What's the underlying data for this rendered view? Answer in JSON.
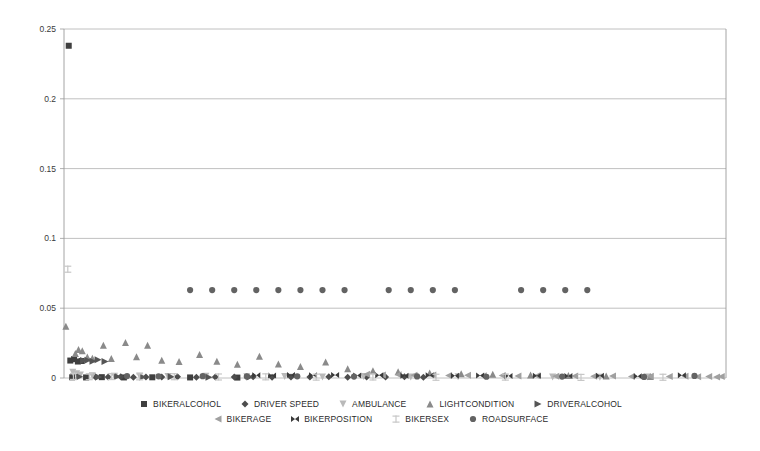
{
  "chart_data": {
    "type": "scatter",
    "title": "",
    "xlabel": "",
    "ylabel": "",
    "ylim": [
      0,
      0.25
    ],
    "xlim": [
      0,
      210
    ],
    "grid": true,
    "y_ticks": [
      0,
      0.05,
      0.1,
      0.15,
      0.2,
      0.25
    ],
    "y_tick_labels": [
      "0",
      "0.05",
      "0.1",
      "0.15",
      "0.2",
      "0.25"
    ],
    "x_axis_visible": false,
    "legend_position": "bottom",
    "series": [
      {
        "name": "BIKERALCOHOL",
        "marker": "square",
        "color": "#3f3f3f",
        "points": [
          {
            "x": 1.5,
            "y": 0.238
          },
          {
            "x": 2.0,
            "y": 0.0125
          },
          {
            "x": 3.2,
            "y": 0.0135
          },
          {
            "x": 4.4,
            "y": 0.0118
          },
          {
            "x": 5.6,
            "y": 0.0122
          },
          {
            "x": 2.6,
            "y": 0.0005
          },
          {
            "x": 7.0,
            "y": 0.0004
          },
          {
            "x": 12.0,
            "y": 0.0006
          },
          {
            "x": 19.0,
            "y": 0.0004
          },
          {
            "x": 28.0,
            "y": 0.0005
          },
          {
            "x": 40.0,
            "y": 0.0004
          },
          {
            "x": 55.0,
            "y": 0.0003
          }
        ]
      },
      {
        "name": "DRIVER SPEED",
        "marker": "diamond",
        "color": "#4d4d4d",
        "points": [
          {
            "x": 10.0,
            "y": 0.0008
          },
          {
            "x": 14.0,
            "y": 0.0007
          },
          {
            "x": 18.0,
            "y": 0.0009
          },
          {
            "x": 22.0,
            "y": 0.0006
          },
          {
            "x": 26.0,
            "y": 0.0008
          },
          {
            "x": 31.0,
            "y": 0.0007
          },
          {
            "x": 36.0,
            "y": 0.0009
          },
          {
            "x": 42.0,
            "y": 0.0006
          },
          {
            "x": 48.0,
            "y": 0.0008
          },
          {
            "x": 54.0,
            "y": 0.0007
          },
          {
            "x": 60.0,
            "y": 0.0009
          },
          {
            "x": 66.0,
            "y": 0.0006
          },
          {
            "x": 72.0,
            "y": 0.0008
          },
          {
            "x": 78.0,
            "y": 0.0007
          },
          {
            "x": 84.0,
            "y": 0.0009
          },
          {
            "x": 90.0,
            "y": 0.0006
          },
          {
            "x": 96.0,
            "y": 0.0008
          },
          {
            "x": 102.0,
            "y": 0.0007
          },
          {
            "x": 108.0,
            "y": 0.0009
          },
          {
            "x": 114.0,
            "y": 0.0006
          }
        ]
      },
      {
        "name": "AMBULANCE",
        "marker": "triangle-down",
        "color": "#b9b9b9",
        "points": [
          {
            "x": 2.8,
            "y": 0.0042
          },
          {
            "x": 4.0,
            "y": 0.003
          },
          {
            "x": 5.2,
            "y": 0.0022
          },
          {
            "x": 9.0,
            "y": 0.0016
          },
          {
            "x": 16.0,
            "y": 0.0012
          },
          {
            "x": 24.0,
            "y": 0.0014
          },
          {
            "x": 33.0,
            "y": 0.001
          },
          {
            "x": 45.0,
            "y": 0.0012
          },
          {
            "x": 58.0,
            "y": 0.0009
          },
          {
            "x": 70.0,
            "y": 0.0011
          },
          {
            "x": 82.0,
            "y": 0.0008
          },
          {
            "x": 95.0,
            "y": 0.001
          },
          {
            "x": 110.0,
            "y": 0.0007
          },
          {
            "x": 125.0,
            "y": 0.0009
          },
          {
            "x": 140.0,
            "y": 0.0006
          },
          {
            "x": 155.0,
            "y": 0.0008
          },
          {
            "x": 170.0,
            "y": 0.0006
          },
          {
            "x": 185.0,
            "y": 0.0007
          }
        ]
      },
      {
        "name": "LIGHTCONDITION",
        "marker": "triangle-up",
        "color": "#8a8a8a",
        "points": [
          {
            "x": 0.6,
            "y": 0.037
          },
          {
            "x": 3.6,
            "y": 0.0175
          },
          {
            "x": 4.6,
            "y": 0.0205
          },
          {
            "x": 5.8,
            "y": 0.0195
          },
          {
            "x": 7.4,
            "y": 0.015
          },
          {
            "x": 9.0,
            "y": 0.0142
          },
          {
            "x": 12.5,
            "y": 0.0235
          },
          {
            "x": 15.0,
            "y": 0.014
          },
          {
            "x": 19.5,
            "y": 0.0255
          },
          {
            "x": 23.0,
            "y": 0.0152
          },
          {
            "x": 26.5,
            "y": 0.0235
          },
          {
            "x": 31.0,
            "y": 0.0128
          },
          {
            "x": 36.5,
            "y": 0.0118
          },
          {
            "x": 43.0,
            "y": 0.0168
          },
          {
            "x": 48.5,
            "y": 0.012
          },
          {
            "x": 55.0,
            "y": 0.0098
          },
          {
            "x": 62.0,
            "y": 0.0155
          },
          {
            "x": 68.0,
            "y": 0.01
          },
          {
            "x": 75.0,
            "y": 0.0082
          },
          {
            "x": 83.0,
            "y": 0.0115
          },
          {
            "x": 90.0,
            "y": 0.0066
          },
          {
            "x": 98.0,
            "y": 0.0052
          },
          {
            "x": 106.0,
            "y": 0.0044
          },
          {
            "x": 116.0,
            "y": 0.0036
          },
          {
            "x": 126.0,
            "y": 0.003
          },
          {
            "x": 136.0,
            "y": 0.0026
          },
          {
            "x": 148.0,
            "y": 0.0022
          },
          {
            "x": 160.0,
            "y": 0.0018
          },
          {
            "x": 172.0,
            "y": 0.0014
          },
          {
            "x": 186.0,
            "y": 0.0011
          }
        ]
      },
      {
        "name": "DRIVERALCOHOL",
        "marker": "triangle-right",
        "color": "#555555",
        "points": [
          {
            "x": 6.2,
            "y": 0.0125
          },
          {
            "x": 7.6,
            "y": 0.0128
          },
          {
            "x": 9.2,
            "y": 0.012
          },
          {
            "x": 10.8,
            "y": 0.013
          },
          {
            "x": 13.0,
            "y": 0.0118
          },
          {
            "x": 5.0,
            "y": 0.0009
          },
          {
            "x": 11.0,
            "y": 0.0008
          },
          {
            "x": 17.0,
            "y": 0.001
          },
          {
            "x": 25.0,
            "y": 0.0007
          },
          {
            "x": 34.0,
            "y": 0.0009
          },
          {
            "x": 46.0,
            "y": 0.0006
          },
          {
            "x": 59.0,
            "y": 0.0008
          }
        ]
      },
      {
        "name": "BIKERAGE",
        "marker": "triangle-left",
        "color": "#a0a0a0",
        "points": [
          {
            "x": 96.0,
            "y": 0.0026
          },
          {
            "x": 101.0,
            "y": 0.0022
          },
          {
            "x": 106.0,
            "y": 0.0024
          },
          {
            "x": 111.0,
            "y": 0.002
          },
          {
            "x": 117.0,
            "y": 0.0022
          },
          {
            "x": 122.0,
            "y": 0.0018
          },
          {
            "x": 128.0,
            "y": 0.002
          },
          {
            "x": 133.0,
            "y": 0.0016
          },
          {
            "x": 139.0,
            "y": 0.0018
          },
          {
            "x": 144.0,
            "y": 0.0015
          },
          {
            "x": 150.0,
            "y": 0.0017
          },
          {
            "x": 156.0,
            "y": 0.0013
          },
          {
            "x": 162.0,
            "y": 0.0015
          },
          {
            "x": 168.0,
            "y": 0.0012
          },
          {
            "x": 174.0,
            "y": 0.0014
          },
          {
            "x": 180.0,
            "y": 0.0011
          },
          {
            "x": 186.0,
            "y": 0.0013
          },
          {
            "x": 192.0,
            "y": 0.001
          },
          {
            "x": 197.0,
            "y": 0.0012
          },
          {
            "x": 201.0,
            "y": 0.0009
          },
          {
            "x": 204.5,
            "y": 0.0011
          },
          {
            "x": 207.0,
            "y": 0.0008
          },
          {
            "x": 208.5,
            "y": 0.001
          }
        ]
      },
      {
        "name": "BIKERPOSITION",
        "marker": "bowtie",
        "color": "#3a3a3a",
        "points": [
          {
            "x": 61.0,
            "y": 0.002
          },
          {
            "x": 66.0,
            "y": 0.0018
          },
          {
            "x": 72.0,
            "y": 0.0022
          },
          {
            "x": 79.0,
            "y": 0.0019
          },
          {
            "x": 86.0,
            "y": 0.0021
          },
          {
            "x": 93.0,
            "y": 0.0018
          },
          {
            "x": 100.0,
            "y": 0.002
          },
          {
            "x": 108.0,
            "y": 0.0017
          },
          {
            "x": 116.0,
            "y": 0.0019
          },
          {
            "x": 124.0,
            "y": 0.0016
          },
          {
            "x": 132.0,
            "y": 0.0018
          },
          {
            "x": 141.0,
            "y": 0.0015
          },
          {
            "x": 150.0,
            "y": 0.0017
          },
          {
            "x": 160.0,
            "y": 0.0014
          },
          {
            "x": 170.0,
            "y": 0.0016
          },
          {
            "x": 182.0,
            "y": 0.0013
          },
          {
            "x": 196.0,
            "y": 0.002
          }
        ]
      },
      {
        "name": "BIKERSEX",
        "marker": "ibeam",
        "color": "#c7c7c7",
        "points": [
          {
            "x": 1.2,
            "y": 0.078
          },
          {
            "x": 3.0,
            "y": 0.0012
          },
          {
            "x": 8.0,
            "y": 0.001
          },
          {
            "x": 15.0,
            "y": 0.0011
          },
          {
            "x": 24.0,
            "y": 0.0009
          },
          {
            "x": 35.0,
            "y": 0.001
          },
          {
            "x": 49.0,
            "y": 0.0008
          },
          {
            "x": 64.0,
            "y": 0.0009
          },
          {
            "x": 80.0,
            "y": 0.0007
          },
          {
            "x": 98.0,
            "y": 0.0008
          },
          {
            "x": 118.0,
            "y": 0.0006
          },
          {
            "x": 140.0,
            "y": 0.0007
          },
          {
            "x": 164.0,
            "y": 0.0005
          },
          {
            "x": 190.0,
            "y": 0.0006
          }
        ]
      },
      {
        "name": "ROADSURFACE",
        "marker": "circle",
        "color": "#636363",
        "points": [
          {
            "x": 40.0,
            "y": 0.063
          },
          {
            "x": 47.0,
            "y": 0.063
          },
          {
            "x": 54.0,
            "y": 0.063
          },
          {
            "x": 61.0,
            "y": 0.063
          },
          {
            "x": 68.0,
            "y": 0.063
          },
          {
            "x": 75.0,
            "y": 0.063
          },
          {
            "x": 82.0,
            "y": 0.063
          },
          {
            "x": 89.0,
            "y": 0.063
          },
          {
            "x": 103.0,
            "y": 0.063
          },
          {
            "x": 110.0,
            "y": 0.063
          },
          {
            "x": 117.0,
            "y": 0.063
          },
          {
            "x": 124.0,
            "y": 0.063
          },
          {
            "x": 145.0,
            "y": 0.063
          },
          {
            "x": 152.0,
            "y": 0.063
          },
          {
            "x": 159.0,
            "y": 0.063
          },
          {
            "x": 166.0,
            "y": 0.063
          },
          {
            "x": 20.0,
            "y": 0.0014
          },
          {
            "x": 30.0,
            "y": 0.0012
          },
          {
            "x": 44.0,
            "y": 0.0013
          },
          {
            "x": 58.0,
            "y": 0.0011
          },
          {
            "x": 74.0,
            "y": 0.0012
          },
          {
            "x": 92.0,
            "y": 0.001
          },
          {
            "x": 112.0,
            "y": 0.0011
          },
          {
            "x": 134.0,
            "y": 0.0009
          },
          {
            "x": 158.0,
            "y": 0.001
          },
          {
            "x": 184.0,
            "y": 0.0008
          },
          {
            "x": 200.0,
            "y": 0.0015
          }
        ]
      }
    ]
  },
  "legend": {
    "rows": [
      [
        {
          "label": "BIKERALCOHOL",
          "marker": "square",
          "color": "#3f3f3f"
        },
        {
          "label": "DRIVER SPEED",
          "marker": "diamond",
          "color": "#4d4d4d"
        },
        {
          "label": "AMBULANCE",
          "marker": "triangle-down",
          "color": "#b9b9b9"
        },
        {
          "label": "LIGHTCONDITION",
          "marker": "triangle-up",
          "color": "#8a8a8a"
        },
        {
          "label": "DRIVERALCOHOL",
          "marker": "triangle-right",
          "color": "#555555"
        }
      ],
      [
        {
          "label": "BIKERAGE",
          "marker": "triangle-left",
          "color": "#a0a0a0"
        },
        {
          "label": "BIKERPOSITION",
          "marker": "bowtie",
          "color": "#3a3a3a"
        },
        {
          "label": "BIKERSEX",
          "marker": "ibeam",
          "color": "#c7c7c7"
        },
        {
          "label": "ROADSURFACE",
          "marker": "circle",
          "color": "#636363"
        }
      ]
    ]
  },
  "style": {
    "grid_color": "#b0b0b0",
    "axis_color": "#9a9a9a",
    "background": "#ffffff",
    "text_color": "#3a3a3a"
  }
}
